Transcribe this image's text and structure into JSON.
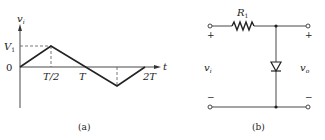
{
  "figure_a": {
    "caption": "(a)",
    "y_axis_label": "v",
    "y_axis_sub": "i",
    "x_axis_label": "t",
    "peak_label": "V",
    "peak_sub": "1",
    "zero_label": "0",
    "ticks": [
      "T/2",
      "T",
      "2T"
    ],
    "waveform": "triangle: 0 at t=0, +V1 at T/2, 0 at T, -V1 at 3T/2, 0 at 2T"
  },
  "figure_b": {
    "caption": "(b)",
    "resistor_label": "R",
    "resistor_sub": "1",
    "input_label": "v",
    "input_sub": "i",
    "output_label": "v",
    "output_sub": "o",
    "plus": "+",
    "minus": "−"
  },
  "colors": {
    "line": "#222222",
    "dashed": "#555555",
    "background": "#ffffff"
  }
}
